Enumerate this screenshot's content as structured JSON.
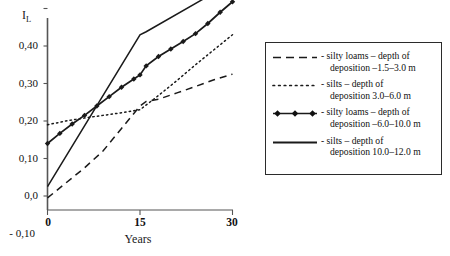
{
  "chart_data": {
    "type": "line",
    "title": "",
    "xlabel": "Years",
    "ylabel": "I_L",
    "ylabel_main": "I",
    "ylabel_sub": "L",
    "xlim": [
      0,
      30
    ],
    "ylim": [
      -0.13,
      0.49
    ],
    "grid": false,
    "legend_position": "right",
    "decimal_separator": ",",
    "xticks": [
      0,
      15,
      30
    ],
    "xtick_labels": [
      "0",
      "15",
      "30"
    ],
    "yticks": [
      -0.1,
      0.0,
      0.1,
      0.2,
      0.3,
      0.4
    ],
    "ytick_labels": [
      "- 0,10",
      "0,0",
      "0,10",
      "0,20",
      "0,30",
      "0,40"
    ],
    "series": [
      {
        "name": "silty loams – depth of deposition –1.5–3.0 m",
        "style": "dashed",
        "marker": "none",
        "color": "#1a1a1a",
        "x": [
          0,
          3,
          6,
          9,
          12,
          15,
          16,
          18,
          21,
          24,
          27,
          30
        ],
        "values": [
          -0.105,
          -0.065,
          -0.025,
          0.02,
          0.08,
          0.14,
          0.152,
          0.158,
          0.175,
          0.192,
          0.21,
          0.225
        ]
      },
      {
        "name": "silts – depth of deposition 3.0–6.0 m",
        "style": "dotted",
        "marker": "none",
        "color": "#1a1a1a",
        "x": [
          0,
          3,
          6,
          9,
          12,
          15,
          18,
          21,
          24,
          27,
          30
        ],
        "values": [
          0.09,
          0.1,
          0.108,
          0.115,
          0.122,
          0.13,
          0.168,
          0.208,
          0.25,
          0.29,
          0.33
        ]
      },
      {
        "name": "silty loams – depth of deposition –6.0–10.0 m",
        "style": "solid",
        "marker": "diamond",
        "color": "#1a1a1a",
        "x": [
          0,
          2,
          4,
          6,
          8,
          10,
          12,
          14,
          15,
          16,
          18,
          20,
          22,
          24,
          26,
          28,
          30
        ],
        "values": [
          0.04,
          0.067,
          0.092,
          0.115,
          0.14,
          0.165,
          0.19,
          0.212,
          0.223,
          0.247,
          0.272,
          0.292,
          0.312,
          0.333,
          0.36,
          0.39,
          0.418
        ]
      },
      {
        "name": "silts – depth of deposition 10.0–12.0 m",
        "style": "solid",
        "marker": "none",
        "color": "#1a1a1a",
        "x": [
          0,
          15,
          16,
          30
        ],
        "values": [
          -0.075,
          0.33,
          0.338,
          0.47
        ]
      }
    ]
  },
  "axes": {
    "y_title_main": "I",
    "y_title_sub": "L",
    "x_title": "Years",
    "ytick_0": "0,40",
    "ytick_1": "0,30",
    "ytick_2": "0,20",
    "ytick_3": "0,10",
    "ytick_4": "0,0",
    "ytick_5": "- 0,10",
    "xtick_0": "0",
    "xtick_1": "15",
    "xtick_2": "30"
  },
  "legend": {
    "items": [
      {
        "sample": "dashed-line-sample",
        "line1": "- silty loams – depth of",
        "line2": "deposition –1.5–3.0 m"
      },
      {
        "sample": "dotted-line-sample",
        "line1": "- silts – depth of",
        "line2": "deposition 3.0–6.0 m"
      },
      {
        "sample": "marker-line-sample",
        "line1": "- silty loams – depth of",
        "line2": "deposition –6.0–10.0 m"
      },
      {
        "sample": "solid-line-sample",
        "line1": "- silts – depth of",
        "line2": "deposition 10.0–12.0 m"
      }
    ]
  },
  "colors": {
    "ink": "#1a1a1a",
    "axis": "#3a3a3a",
    "background": "#ffffff"
  }
}
